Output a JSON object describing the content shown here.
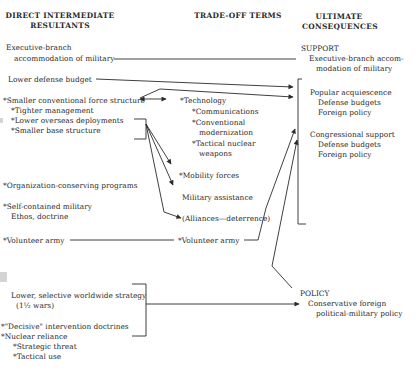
{
  "headers": {
    "col1": [
      "DIRECT INTERMEDIATE",
      "RESULTANTS"
    ],
    "col2": "TRADE-OFF TERMS",
    "col3": [
      "ULTIMATE",
      "CONSEQUENCES"
    ]
  },
  "left": {
    "exec_branch": [
      "Executive-branch",
      "accommodation of military"
    ],
    "lower_budget": "Lower defense budget",
    "smaller_force": "*Smaller conventional force structure",
    "tighter_mgmt": "*Tighter management",
    "lower_overseas": "*Lower overseas deployments",
    "smaller_base": "*Smaller base structure",
    "org_conserving": "*Organization-conserving programs",
    "self_contained": [
      "*Self-contained military",
      "Ethos, doctrine"
    ],
    "volunteer": "*Volunteer army",
    "lower_selective": [
      "Lower, selective worldwide strategy",
      "(1½ wars)"
    ],
    "decisive": "*\"Decisive\" intervention doctrines",
    "nuclear": "*Nuclear reliance",
    "strategic_threat": "*Strategic threat",
    "tactical_use": "*Tactical use"
  },
  "middle": {
    "technology": "*Technology",
    "communications": "*Communications",
    "conventional": [
      "*Conventional",
      "modernization"
    ],
    "tactical_nuclear": [
      "*Tactical nuclear",
      "weapons"
    ],
    "mobility": "*Mobility forces",
    "military_assistance": "Military assistance",
    "alliances": "(Alliances—deterrence)",
    "volunteer": "*Volunteer army"
  },
  "right": {
    "support": "SUPPORT",
    "exec_accom": [
      "Executive-branch accom-",
      "modation of military"
    ],
    "popular": "Popular acquiescence",
    "popular_items": [
      "Defense budgets",
      "Foreign policy"
    ],
    "congressional": "Congressional support",
    "congressional_items": [
      "Defense budgets",
      "Foreign policy"
    ],
    "policy": "POLICY",
    "policy_items": [
      "Conservative foreign",
      "political-military policy"
    ]
  },
  "colors": {
    "ink": "#2a2a2a",
    "background": "#ffffff"
  }
}
